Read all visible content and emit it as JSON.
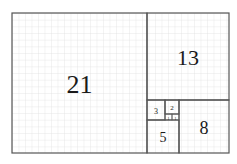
{
  "diagram": {
    "type": "fibonacci-rectangle",
    "colors": {
      "background": "#ffffff",
      "grid": "#d9d9d9",
      "border": "#555555",
      "text": "#1a1a1a"
    },
    "squares": [
      {
        "label": "21",
        "x": 12,
        "y": 13,
        "w": 135,
        "h": 140,
        "font_size": 26
      },
      {
        "label": "13",
        "x": 147,
        "y": 13,
        "w": 82,
        "h": 87,
        "font_size": 22
      },
      {
        "label": "8",
        "x": 179,
        "y": 100,
        "w": 50,
        "h": 53,
        "font_size": 18
      },
      {
        "label": "5",
        "x": 147,
        "y": 120,
        "w": 32,
        "h": 33,
        "font_size": 14
      },
      {
        "label": "3",
        "x": 147,
        "y": 100,
        "w": 18,
        "h": 20,
        "font_size": 8
      },
      {
        "label": "2",
        "x": 165,
        "y": 100,
        "w": 14,
        "h": 14,
        "font_size": 7
      },
      {
        "label": "1",
        "x": 165,
        "y": 114,
        "w": 7,
        "h": 6,
        "font_size": 4
      },
      {
        "label": "1",
        "x": 172,
        "y": 114,
        "w": 7,
        "h": 6,
        "font_size": 4
      }
    ]
  }
}
